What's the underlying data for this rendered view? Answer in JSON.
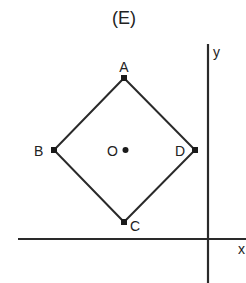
{
  "title": "(E)",
  "axes": {
    "x_label": "x",
    "y_label": "y"
  },
  "points": {
    "A": {
      "label": "A",
      "x": 124,
      "y": 78
    },
    "B": {
      "label": "B",
      "x": 54,
      "y": 150
    },
    "C": {
      "label": "C",
      "x": 124,
      "y": 222
    },
    "D": {
      "label": "D",
      "x": 195,
      "y": 150
    },
    "O": {
      "label": "O",
      "x": 125,
      "y": 150
    }
  },
  "colors": {
    "stroke": "#2a2a2a"
  }
}
